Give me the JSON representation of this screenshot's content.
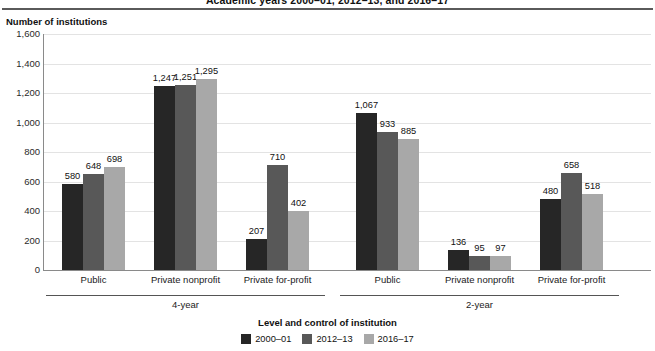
{
  "header": {
    "title_cropped": "Academic years 2000–01, 2012–13, and 2016–17"
  },
  "axis": {
    "y_caption": "Number of institutions",
    "x_title": "Level and control of institution"
  },
  "legend": {
    "items": [
      {
        "label": "2000–01",
        "color": "#262626"
      },
      {
        "label": "2012–13",
        "color": "#585858"
      },
      {
        "label": "2016–17",
        "color": "#a8a8a8"
      }
    ]
  },
  "supergroups": [
    {
      "label": "4-year"
    },
    {
      "label": "2-year"
    }
  ],
  "chart_data": {
    "type": "bar",
    "title": "Academic years 2000–01, 2012–13, and 2016–17",
    "xlabel": "Level and control of institution",
    "ylabel": "Number of institutions",
    "ylim": [
      0,
      1600
    ],
    "yticks": [
      "0",
      "200",
      "400",
      "600",
      "800",
      "1,000",
      "1,200",
      "1,400",
      "1,600"
    ],
    "grid": true,
    "legend_position": "bottom",
    "categories": [
      "Public",
      "Private nonprofit",
      "Private for-profit",
      "Public",
      "Private nonprofit",
      "Private for-profit"
    ],
    "category_groups": [
      "4-year",
      "4-year",
      "4-year",
      "2-year",
      "2-year",
      "2-year"
    ],
    "series": [
      {
        "name": "2000–01",
        "color": "#262626",
        "values": [
          580,
          1247,
          207,
          1067,
          136,
          480
        ],
        "labels": [
          "580",
          "1,247",
          "207",
          "1,067",
          "136",
          "480"
        ]
      },
      {
        "name": "2012–13",
        "color": "#585858",
        "values": [
          648,
          1251,
          710,
          933,
          95,
          658
        ],
        "labels": [
          "648",
          "1,251",
          "710",
          "933",
          "95",
          "658"
        ]
      },
      {
        "name": "2016–17",
        "color": "#a8a8a8",
        "values": [
          698,
          1295,
          402,
          885,
          97,
          518
        ],
        "labels": [
          "698",
          "1,295",
          "402",
          "885",
          "97",
          "518"
        ]
      }
    ]
  }
}
